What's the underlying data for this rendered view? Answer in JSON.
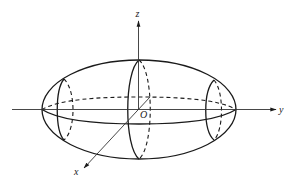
{
  "diagram": {
    "type": "ellipsoid-of-revolution",
    "colors": {
      "stroke": "#1a1a1a",
      "axis": "#333333",
      "background": "#ffffff"
    },
    "axes": {
      "z": {
        "label": "z"
      },
      "y": {
        "label": "y"
      },
      "x": {
        "label": "x"
      },
      "origin": {
        "label": "O"
      }
    }
  }
}
